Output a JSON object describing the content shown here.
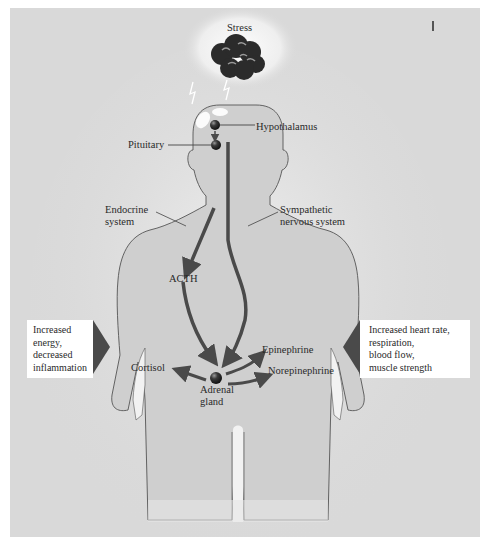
{
  "diagram": {
    "stressor_label": "Stress",
    "labels": {
      "hypothalamus": "Hypothalamus",
      "pituitary": "Pituitary",
      "endocrine_system_line1": "Endocrine",
      "endocrine_system_line2": "system",
      "sympathetic_line1": "Sympathetic",
      "sympathetic_line2": "nervous system",
      "acth": "ACTH",
      "cortisol": "Cortisol",
      "epinephrine": "Epinephrine",
      "norepinephrine": "Norepinephrine",
      "adrenal_line1": "Adrenal",
      "adrenal_line2": "gland"
    },
    "left_effect_box": {
      "lines": [
        "Increased",
        "energy,",
        "decreased",
        "inflammation"
      ]
    },
    "right_effect_box": {
      "lines": [
        "Increased heart rate,",
        "respiration,",
        "blood flow,",
        "muscle strength"
      ]
    },
    "colors": {
      "background": "#d9d9d9",
      "body_fill": "#cfcfcf",
      "outline": "#555555",
      "arrow": "#4a4a4a",
      "cloud": "#2b2b2b",
      "box": "#ffffff"
    }
  }
}
